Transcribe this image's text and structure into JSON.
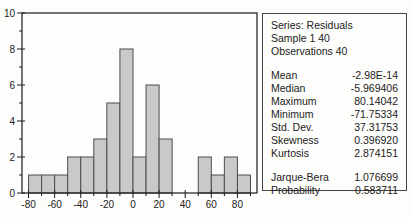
{
  "chart_data": {
    "type": "bar",
    "subtype": "histogram",
    "series_name": "Residuals",
    "bin_start": -80,
    "bin_width": 10,
    "counts": [
      1,
      1,
      1,
      2,
      2,
      3,
      5,
      8,
      2,
      6,
      3,
      0,
      0,
      2,
      1,
      2,
      1
    ],
    "xlim": [
      -85,
      95
    ],
    "ylim": [
      0,
      10
    ],
    "x_major_ticks": [
      -80,
      -60,
      -40,
      -20,
      0,
      20,
      40,
      60,
      80
    ],
    "x_major_labels": [
      "-80",
      "-60",
      "-40",
      "-20",
      "0",
      "20",
      "40",
      "60",
      "80"
    ],
    "x_minor_ticks": [
      -70,
      -50,
      -30,
      -10,
      10,
      30,
      50,
      70,
      90
    ],
    "y_major_ticks": [
      0,
      2,
      4,
      6,
      8,
      10
    ],
    "y_major_labels": [
      "0",
      "2",
      "4",
      "6",
      "8",
      "10"
    ],
    "y_minor_ticks": [
      1,
      3,
      5,
      7,
      9
    ],
    "grid": false,
    "legend": "none",
    "title": "",
    "xlabel": "",
    "ylabel": ""
  },
  "stats": {
    "header": {
      "series_line": "Series: Residuals",
      "sample_line": "Sample 1 40",
      "observations_line": "Observations 40"
    },
    "rows": [
      {
        "label": "Mean",
        "value": "-2.98E-14"
      },
      {
        "label": "Median",
        "value": "-5.969406"
      },
      {
        "label": "Maximum",
        "value": "80.14042"
      },
      {
        "label": "Minimum",
        "value": "-71.75334"
      },
      {
        "label": "Std. Dev.",
        "value": "37.31753"
      },
      {
        "label": "Skewness",
        "value": "0.396920"
      },
      {
        "label": "Kurtosis",
        "value": "2.874151"
      }
    ],
    "rows2": [
      {
        "label": "Jarque-Bera",
        "value": "1.076699"
      },
      {
        "label": "Probability",
        "value": "0.583711"
      }
    ]
  },
  "colors": {
    "bar_fill": "#c9c9c9",
    "bar_stroke": "#4d4d4d",
    "frame": "#1c1c1c",
    "tick": "#1c1c1c",
    "text": "#222222",
    "box_border": "#444444",
    "background": "#fdfdfb"
  }
}
